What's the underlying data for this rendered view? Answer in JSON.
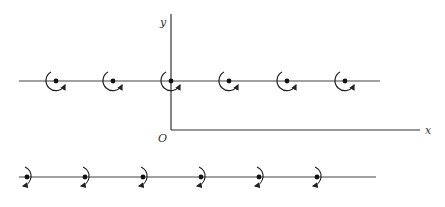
{
  "diagram": {
    "type": "rotation-vectors-on-lines",
    "colors": {
      "stroke": "#444444",
      "axis": "#333333",
      "label": "#333333",
      "background": "#ffffff"
    },
    "axes": {
      "origin": {
        "x": 171,
        "y": 130
      },
      "x_axis_end": {
        "x": 420,
        "y": 130
      },
      "y_axis_top": {
        "x": 171,
        "y": 14
      },
      "labels": {
        "y": "y",
        "x": "x",
        "origin": "O"
      }
    },
    "rows": [
      {
        "name": "upper-row",
        "line": {
          "x1": 19,
          "x2": 380,
          "y": 81
        },
        "rotation": "counterclockwise-around-left-bottom",
        "points_x": [
          56,
          113,
          171,
          229,
          287,
          345
        ]
      },
      {
        "name": "lower-row",
        "line": {
          "x1": 19,
          "x2": 376,
          "y": 177
        },
        "rotation": "clockwise-around-right",
        "points_x": [
          27,
          85,
          143,
          201,
          259,
          317
        ]
      }
    ]
  }
}
